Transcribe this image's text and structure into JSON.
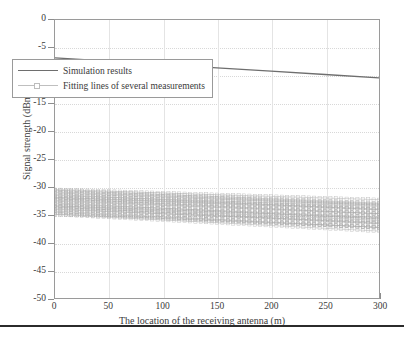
{
  "chart_data": {
    "type": "line",
    "title": "",
    "xlabel": "The location of the receiving antenna (m)",
    "ylabel": "Signal strength (dBm)",
    "xlim": [
      0,
      300
    ],
    "ylim": [
      -50,
      0
    ],
    "xticks": [
      0,
      50,
      100,
      150,
      200,
      250,
      300
    ],
    "yticks": [
      0,
      -5,
      -10,
      -15,
      -20,
      -25,
      -30,
      -35,
      -40,
      -45,
      -50
    ],
    "xticklabels": [
      "0",
      "50",
      "100",
      "150",
      "200",
      "250",
      "300"
    ],
    "yticklabels": [
      "0",
      "-5",
      "-10",
      "-15",
      "-20",
      "-25",
      "-30",
      "-35",
      "-40",
      "-45",
      "-50"
    ],
    "grid": true,
    "legend_position": "upper left",
    "series": [
      {
        "name": "Simulation results",
        "style": "solid-line",
        "color": "#6e6e6e",
        "x": [
          0,
          50,
          100,
          150,
          200,
          250,
          300
        ],
        "values": [
          -6.8,
          -7.4,
          -8.0,
          -8.6,
          -9.2,
          -9.8,
          -10.4
        ]
      },
      {
        "name": "Fitting lines of several measurements",
        "style": "line-with-square-markers",
        "color": "#a9a9a9",
        "description": "Dense band of many fitted measurement lines",
        "band_upper": {
          "x": [
            0,
            300
          ],
          "values": [
            -30.5,
            -32.6
          ]
        },
        "band_lower": {
          "x": [
            0,
            300
          ],
          "values": [
            -35.0,
            -37.8
          ]
        },
        "line_count": 22,
        "marker_count_per_line": 60
      }
    ]
  },
  "legend": {
    "items": [
      {
        "label": "Simulation results",
        "marker": "none"
      },
      {
        "label": "Fitting lines of several measurements",
        "marker": "square"
      }
    ]
  },
  "colors": {
    "simulation_line": "#6e6e6e",
    "fitting_lines": "#a9a9a9",
    "axis": "#9a9a9a",
    "grid": "#d8d8d8",
    "text": "#3a3a3a",
    "bottom_rule": "#2b2b2b"
  }
}
